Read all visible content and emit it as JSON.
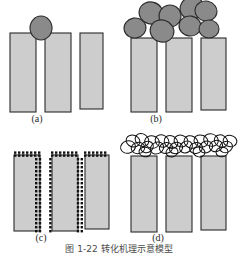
{
  "figure": {
    "caption": "图 1-22  转化机理示意模型",
    "colors": {
      "pillar_fill": "#cdcdcd",
      "pillar_stroke": "#2b2b2b",
      "particle_fill": "#8a8a8a",
      "particle_stroke": "#2b2b2b",
      "dot_fill": "#111111",
      "open_circle_stroke": "#111111",
      "background": "#ffffff",
      "label_color": "#2b2b2b"
    },
    "panels": [
      {
        "id": "a",
        "label": "(a)",
        "description": "three light-gray pillars with a single dark ellipse resting on top between pillar one and pillar two",
        "pillar_count": 3,
        "particle_count": 1,
        "particle_style": "filled-ellipse",
        "pillars": [
          {
            "x": 10,
            "y": 33,
            "width": 26,
            "height": 79
          },
          {
            "x": 45,
            "y": 33,
            "width": 26,
            "height": 79
          },
          {
            "x": 80,
            "y": 33,
            "width": 23,
            "height": 76
          }
        ],
        "particles": [
          {
            "cx": 41,
            "cy": 28,
            "rx": 11,
            "ry": 12,
            "rotate": 0
          }
        ]
      },
      {
        "id": "b",
        "label": "(b)",
        "description": "three light-gray pillars capped by a cluster of eight dark filled circles",
        "pillar_count": 3,
        "particle_count": 8,
        "particle_style": "filled-circle",
        "pillars": [
          {
            "x": 131,
            "y": 38,
            "width": 26,
            "height": 74
          },
          {
            "x": 166,
            "y": 38,
            "width": 26,
            "height": 74
          },
          {
            "x": 201,
            "y": 38,
            "width": 25,
            "height": 72
          }
        ],
        "particles": [
          {
            "cx": 135,
            "cy": 28,
            "rx": 11,
            "ry": 10,
            "rotate": -10
          },
          {
            "cx": 151,
            "cy": 13,
            "rx": 12,
            "ry": 11,
            "rotate": 15
          },
          {
            "cx": 162,
            "cy": 31,
            "rx": 12,
            "ry": 11,
            "rotate": 20
          },
          {
            "cx": 170,
            "cy": 16,
            "rx": 11,
            "ry": 11,
            "rotate": -12
          },
          {
            "cx": 190,
            "cy": 26,
            "rx": 11,
            "ry": 10,
            "rotate": 8
          },
          {
            "cx": 192,
            "cy": 8,
            "rx": 12,
            "ry": 11,
            "rotate": -18
          },
          {
            "cx": 209,
            "cy": 29,
            "rx": 10,
            "ry": 9,
            "rotate": 0
          },
          {
            "cx": 206,
            "cy": 11,
            "rx": 11,
            "ry": 10,
            "rotate": 12
          }
        ]
      },
      {
        "id": "c",
        "label": "(c)",
        "description": "three light-gray pillars decorated with rows of small black squares along their top and side surfaces",
        "pillar_count": 3,
        "particle_style": "small-black-squares",
        "dot_size": 2.4,
        "pillars": [
          {
            "x": 14,
            "y": 155,
            "width": 26,
            "height": 76,
            "dots": [
              "top",
              "right"
            ]
          },
          {
            "x": 52,
            "y": 155,
            "width": 26,
            "height": 76,
            "dots": [
              "top",
              "left",
              "right"
            ]
          },
          {
            "x": 85,
            "y": 155,
            "width": 24,
            "height": 74,
            "dots": [
              "top",
              "left"
            ]
          }
        ]
      },
      {
        "id": "d",
        "label": "(d)",
        "description": "three light-gray pillars covered by a dense mat of overlapping unfilled circle outlines",
        "pillar_count": 3,
        "particle_style": "open-circle-chain",
        "open_circle_count": 26,
        "pillars": [
          {
            "x": 131,
            "y": 156,
            "width": 26,
            "height": 76
          },
          {
            "x": 166,
            "y": 156,
            "width": 26,
            "height": 76
          },
          {
            "x": 201,
            "y": 156,
            "width": 25,
            "height": 74
          }
        ]
      }
    ],
    "labels": [
      {
        "id": "label-a",
        "text": "(a)",
        "x": 37,
        "y": 114
      },
      {
        "id": "label-b",
        "text": "(b)",
        "x": 156,
        "y": 114
      },
      {
        "id": "label-c",
        "text": "(c)",
        "x": 41,
        "y": 233
      },
      {
        "id": "label-d",
        "text": "(d)",
        "x": 158,
        "y": 233
      }
    ]
  }
}
